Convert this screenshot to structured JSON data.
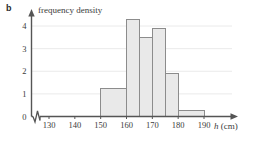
{
  "figure": {
    "part_label": "b",
    "y_axis_title": "frequency density",
    "x_axis_title_var": "h",
    "x_axis_title_unit": "(cm)",
    "axis_break_symbol": "zigzag-break"
  },
  "colors": {
    "bar_fill": "#e9e9e9",
    "bar_stroke": "#8c8c8c",
    "axis": "#555555",
    "grid": "#e4e4e4",
    "text": "#3b3b3b",
    "background": "#ffffff"
  },
  "chart_data": {
    "type": "bar",
    "title": "",
    "subtitle": "",
    "xlabel": "h (cm)",
    "ylabel": "frequency density",
    "xlim": [
      125,
      193
    ],
    "ylim": [
      0,
      4.6
    ],
    "grid": true,
    "legend": "none",
    "y_ticks": [
      0,
      1,
      2,
      3,
      4
    ],
    "y_tick_labels": [
      "0",
      "1",
      "2",
      "3",
      "4"
    ],
    "x_ticks": [
      130,
      140,
      150,
      160,
      170,
      180,
      190
    ],
    "x_tick_labels": [
      "130",
      "140",
      "150",
      "160",
      "170",
      "180",
      "190"
    ],
    "bins": [
      {
        "label": "150-160",
        "start": 150,
        "end": 160,
        "value": 1.25
      },
      {
        "label": "160-165",
        "start": 160,
        "end": 165,
        "value": 4.3
      },
      {
        "label": "165-170",
        "start": 165,
        "end": 170,
        "value": 3.5
      },
      {
        "label": "170-175",
        "start": 170,
        "end": 175,
        "value": 3.9
      },
      {
        "label": "175-180",
        "start": 175,
        "end": 180,
        "value": 1.9
      },
      {
        "label": "180-190",
        "start": 180,
        "end": 190,
        "value": 0.25
      }
    ],
    "categories": [
      "150-160",
      "160-165",
      "165-170",
      "170-175",
      "175-180",
      "180-190"
    ],
    "values": [
      1.25,
      4.3,
      3.5,
      3.9,
      1.9,
      0.25
    ],
    "annotations": [
      "x-axis has a zigzag break between the origin and 130"
    ]
  }
}
